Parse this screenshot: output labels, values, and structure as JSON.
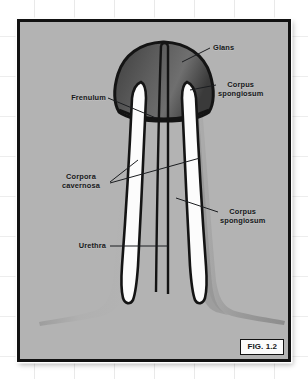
{
  "figure": {
    "caption": "FIG. 1.2",
    "plate_background": "#b3b3b3",
    "border_color": "#121212",
    "page_background": "#ffffff"
  },
  "labels": [
    {
      "id": "glans",
      "text": "Glans",
      "side": "right",
      "x": 193,
      "y": 38,
      "leader": [
        [
          190,
          43
        ],
        [
          167,
          52
        ]
      ]
    },
    {
      "id": "corpus-spongiosum-upper",
      "text_line1": "Corpus",
      "text_line2": "spongiosum",
      "side": "right",
      "x": 213,
      "y": 66,
      "leader": [
        [
          209,
          80
        ],
        [
          176,
          86
        ]
      ]
    },
    {
      "id": "frenulum",
      "text": "Frenulum",
      "side": "left",
      "x": 44,
      "y": 89,
      "leader": [
        [
          101,
          93
        ],
        [
          148,
          111
        ]
      ]
    },
    {
      "id": "corpora-cavernosa",
      "text_line1": "Corpora",
      "text_line2": "cavernosa",
      "side": "left",
      "x": 56,
      "y": 163,
      "leader_a": [
        [
          103,
          175
        ],
        [
          131,
          155
        ]
      ],
      "leader_b": [
        [
          103,
          176
        ],
        [
          193,
          152
        ]
      ]
    },
    {
      "id": "corpus-spongiosum-lower",
      "text_line1": "Corpus",
      "text_line2": "spongiosum",
      "side": "right",
      "x": 215,
      "y": 199,
      "leader": [
        [
          211,
          206
        ],
        [
          170,
          192
        ]
      ]
    },
    {
      "id": "urethra",
      "text": "Urethra",
      "side": "left",
      "x": 64,
      "y": 236,
      "leader": [
        [
          103,
          240
        ],
        [
          160,
          240
        ]
      ]
    }
  ],
  "structures": {
    "glans_fill_dark": "#4a4a4a",
    "glans_fill_light": "#6d6d6d",
    "shaft_fill": "#a8a8a8",
    "shaft_shadow": "#8f8f8f",
    "cavernosa_fill": "#fcfcfc",
    "outline": "#141414"
  }
}
